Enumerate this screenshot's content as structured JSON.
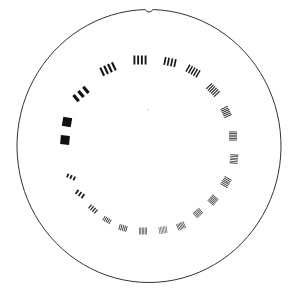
{
  "image": {
    "subject": "circular resolution test target",
    "background": "#ffffff",
    "ink": "#1a1a1a",
    "outline": {
      "cx": 149,
      "cy": 146,
      "rx": 132,
      "ry": 136.5,
      "stroke": "#333333",
      "notch_at": "top"
    },
    "center_dot": {
      "x": 148,
      "y": 110
    },
    "bar_groups": [
      {
        "x": 65,
        "y": 140,
        "angle": 5,
        "bars": 1,
        "w": 9,
        "h": 9,
        "fill": "#111111"
      },
      {
        "x": 67,
        "y": 122,
        "angle": 10,
        "bars": 1,
        "w": 9,
        "h": 9,
        "fill": "#111111"
      },
      {
        "x": 81,
        "y": 94,
        "angle": -40,
        "bars": 3,
        "w": 16,
        "h": 8,
        "fill": "#111111"
      },
      {
        "x": 108,
        "y": 69,
        "angle": -25,
        "bars": 4,
        "w": 15,
        "h": 9,
        "fill": "#151515"
      },
      {
        "x": 140,
        "y": 60,
        "angle": 0,
        "bars": 4,
        "w": 13,
        "h": 9,
        "fill": "#151515"
      },
      {
        "x": 170,
        "y": 62,
        "angle": 12,
        "bars": 4,
        "w": 12,
        "h": 8,
        "fill": "#1a1a1a"
      },
      {
        "x": 193,
        "y": 71,
        "angle": 30,
        "bars": 5,
        "w": 13,
        "h": 8,
        "fill": "#1a1a1a"
      },
      {
        "x": 213,
        "y": 90,
        "angle": 45,
        "bars": 6,
        "w": 12,
        "h": 8,
        "fill": "#1e1e1e"
      },
      {
        "x": 226,
        "y": 112,
        "angle": 65,
        "bars": 6,
        "w": 10,
        "h": 8,
        "fill": "#222222"
      },
      {
        "x": 233,
        "y": 136,
        "angle": 90,
        "bars": 6,
        "w": 9,
        "h": 8,
        "fill": "#262626"
      },
      {
        "x": 234,
        "y": 159,
        "angle": 95,
        "bars": 6,
        "w": 9,
        "h": 8,
        "fill": "#2e2e2e"
      },
      {
        "x": 226,
        "y": 182,
        "angle": 120,
        "bars": 6,
        "w": 9,
        "h": 8,
        "fill": "#363636"
      },
      {
        "x": 213,
        "y": 200,
        "angle": 130,
        "bars": 6,
        "w": 8,
        "h": 8,
        "fill": "#3c3c3c"
      },
      {
        "x": 198,
        "y": 213,
        "angle": 140,
        "bars": 6,
        "w": 8,
        "h": 7,
        "fill": "#404040"
      },
      {
        "x": 181,
        "y": 226,
        "angle": 155,
        "bars": 6,
        "w": 8,
        "h": 7,
        "fill": "#464646"
      },
      {
        "x": 163,
        "y": 230,
        "angle": 170,
        "bars": 6,
        "w": 8,
        "h": 7,
        "fill": "#707070"
      },
      {
        "x": 143,
        "y": 231,
        "angle": 180,
        "bars": 6,
        "w": 8,
        "h": 7,
        "fill": "#4a4a4a"
      },
      {
        "x": 123,
        "y": 228,
        "angle": 195,
        "bars": 5,
        "w": 8,
        "h": 6,
        "fill": "#3a3a3a"
      },
      {
        "x": 107,
        "y": 220,
        "angle": 210,
        "bars": 5,
        "w": 8,
        "h": 5,
        "fill": "#333333"
      },
      {
        "x": 93,
        "y": 209,
        "angle": 220,
        "bars": 4,
        "w": 9,
        "h": 5,
        "fill": "#2a2a2a"
      },
      {
        "x": 80,
        "y": 194,
        "angle": 215,
        "bars": 3,
        "w": 9,
        "h": 5,
        "fill": "#222222"
      },
      {
        "x": 71,
        "y": 177,
        "angle": 205,
        "bars": 3,
        "w": 9,
        "h": 4,
        "fill": "#1e1e1e"
      }
    ]
  }
}
